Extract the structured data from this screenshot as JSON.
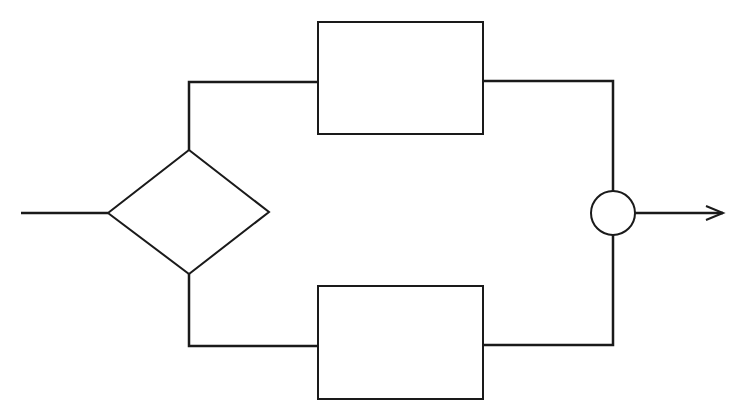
{
  "diagram": {
    "type": "flowchart",
    "colors": {
      "stroke": "#1a1a1a",
      "background": "#ffffff"
    },
    "nodes": [
      {
        "id": "decision",
        "shape": "diamond",
        "label": ""
      },
      {
        "id": "process-top",
        "shape": "rectangle",
        "label": ""
      },
      {
        "id": "process-bottom",
        "shape": "rectangle",
        "label": ""
      },
      {
        "id": "junction",
        "shape": "circle",
        "label": ""
      }
    ],
    "edges": [
      {
        "from": "input",
        "to": "decision"
      },
      {
        "from": "decision",
        "to": "process-top"
      },
      {
        "from": "decision",
        "to": "process-bottom"
      },
      {
        "from": "process-top",
        "to": "junction"
      },
      {
        "from": "process-bottom",
        "to": "junction"
      },
      {
        "from": "junction",
        "to": "output",
        "arrow": true
      }
    ]
  }
}
